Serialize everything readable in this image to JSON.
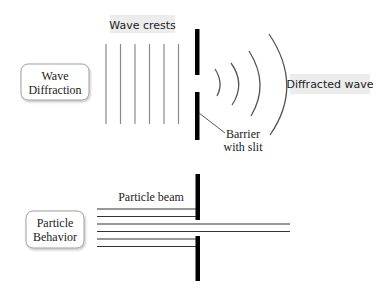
{
  "wave_section": {
    "box_label_line1": "Wave",
    "box_label_line2": "Diffraction",
    "crests_label": "Wave crests",
    "diffracted_label": "Diffracted wave",
    "barrier_label_line1": "Barrier",
    "barrier_label_line2": "with slit"
  },
  "particle_section": {
    "box_label_line1": "Particle",
    "box_label_line2": "Behavior",
    "beam_label": "Particle beam"
  },
  "colors": {
    "crest_line": "#8a8a8a",
    "barrier": "#000000",
    "label_bg": "#ececec",
    "box_border": "#9a9a9a"
  }
}
